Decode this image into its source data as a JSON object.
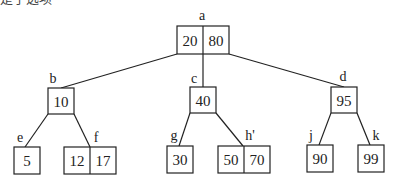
{
  "caption": {
    "text": "是子选项"
  },
  "diagram": {
    "type": "B-tree",
    "nodes": {
      "a": {
        "label": "a",
        "keys": [
          "20",
          "80"
        ]
      },
      "b": {
        "label": "b",
        "keys": [
          "10"
        ]
      },
      "c": {
        "label": "c",
        "keys": [
          "40"
        ]
      },
      "d": {
        "label": "d",
        "keys": [
          "95"
        ]
      },
      "e": {
        "label": "e",
        "keys": [
          "5"
        ]
      },
      "f": {
        "label": "f",
        "keys": [
          "12",
          "17"
        ]
      },
      "g": {
        "label": "g",
        "keys": [
          "30"
        ]
      },
      "h": {
        "label": "h'",
        "keys": [
          "50",
          "70"
        ]
      },
      "j": {
        "label": "j",
        "keys": [
          "90"
        ]
      },
      "k": {
        "label": "k",
        "keys": [
          "99"
        ]
      }
    },
    "edges": [
      [
        "a",
        "b"
      ],
      [
        "a",
        "c"
      ],
      [
        "a",
        "d"
      ],
      [
        "b",
        "e"
      ],
      [
        "b",
        "f"
      ],
      [
        "c",
        "g"
      ],
      [
        "c",
        "h"
      ],
      [
        "d",
        "j"
      ],
      [
        "d",
        "k"
      ]
    ],
    "colors": {
      "stroke": "#222222",
      "background": "#ffffff"
    }
  }
}
